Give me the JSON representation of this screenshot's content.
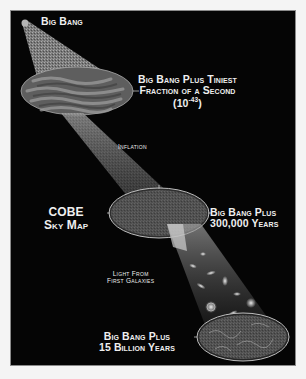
{
  "diagram": {
    "stages": [
      {
        "id": "big-bang",
        "label": "Big Bang"
      },
      {
        "id": "tiniest-fraction",
        "label_lines": [
          "Big Bang Plus Tiniest",
          "Fraction of a Second"
        ],
        "exponent_base": "(10",
        "exponent_power": "-43",
        "exponent_close": ")"
      },
      {
        "id": "inflation",
        "label": "Inflation"
      },
      {
        "id": "cobe",
        "label_lines": [
          "COBE",
          "Sky Map"
        ]
      },
      {
        "id": "300000-years",
        "label_lines": [
          "Big Bang Plus",
          "300,000 Years"
        ]
      },
      {
        "id": "first-galaxies",
        "label_lines": [
          "Light From",
          "First Galaxies"
        ]
      },
      {
        "id": "15-billion-years",
        "label_lines": [
          "Big Bang Plus",
          "15 Billion Years"
        ]
      }
    ],
    "colors": {
      "background": "#050505",
      "page": "#f4f4f4",
      "text": "#efefef",
      "beam": "#9a9a9a",
      "ellipse_fill": "#6a6a6a",
      "ellipse_edge": "#bdbdbd"
    }
  }
}
